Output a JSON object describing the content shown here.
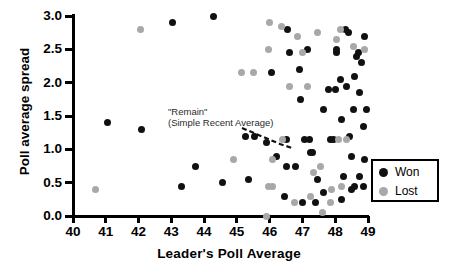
{
  "chart_data": {
    "type": "scatter",
    "title": "",
    "xlabel": "Leader's Poll Average",
    "ylabel": "Poll average spread",
    "xlim": [
      40,
      49
    ],
    "ylim": [
      0.0,
      3.0
    ],
    "xticks": [
      "40",
      "41",
      "42",
      "43",
      "44",
      "45",
      "46",
      "47",
      "48",
      "49"
    ],
    "yticks": [
      "0.0",
      "0.5",
      "1.0",
      "1.5",
      "2.0",
      "2.5",
      "3.0"
    ],
    "grid": false,
    "legend_position": "bottom-right",
    "legend": [
      {
        "name": "Won",
        "color": "#111111"
      },
      {
        "name": "Lost",
        "color": "#a8a8a8"
      }
    ],
    "annotations": [
      {
        "line1": "\"Remain\"",
        "line2": "(Simple Recent Average)",
        "points_to": [
          46.4,
          1.15
        ]
      }
    ],
    "series": [
      {
        "name": "Won",
        "color": "#111111",
        "points": [
          [
            41.05,
            1.4
          ],
          [
            42.1,
            1.3
          ],
          [
            43.05,
            2.9
          ],
          [
            44.3,
            3.0
          ],
          [
            43.75,
            0.75
          ],
          [
            43.3,
            0.45
          ],
          [
            44.55,
            0.5
          ],
          [
            45.25,
            1.2
          ],
          [
            45.55,
            1.2
          ],
          [
            45.9,
            1.1
          ],
          [
            46.45,
            0.3
          ],
          [
            46.5,
            1.15
          ],
          [
            46.05,
            2.15
          ],
          [
            46.6,
            2.45
          ],
          [
            46.55,
            2.8
          ],
          [
            46.9,
            2.2
          ],
          [
            46.95,
            1.75
          ],
          [
            47.15,
            2.5
          ],
          [
            47.05,
            1.15
          ],
          [
            47.2,
            1.15
          ],
          [
            46.5,
            0.75
          ],
          [
            46.8,
            0.75
          ],
          [
            47.25,
            0.95
          ],
          [
            47.3,
            0.95
          ],
          [
            47.45,
            0.55
          ],
          [
            47.0,
            0.2
          ],
          [
            47.4,
            0.2
          ],
          [
            47.65,
            0.35
          ],
          [
            47.65,
            1.6
          ],
          [
            47.85,
            1.15
          ],
          [
            47.95,
            1.15
          ],
          [
            48.0,
            1.9
          ],
          [
            47.8,
            1.9
          ],
          [
            48.05,
            2.45
          ],
          [
            48.05,
            2.5
          ],
          [
            48.15,
            2.05
          ],
          [
            48.2,
            1.45
          ],
          [
            48.25,
            0.6
          ],
          [
            48.2,
            0.25
          ],
          [
            48.5,
            0.4
          ],
          [
            48.5,
            0.9
          ],
          [
            48.45,
            1.2
          ],
          [
            48.55,
            1.6
          ],
          [
            48.6,
            2.1
          ],
          [
            48.65,
            2.4
          ],
          [
            48.7,
            2.45
          ],
          [
            48.8,
            2.3
          ],
          [
            48.9,
            2.7
          ],
          [
            48.75,
            1.85
          ],
          [
            48.85,
            1.35
          ],
          [
            48.9,
            0.85
          ],
          [
            48.85,
            0.45
          ],
          [
            48.6,
            0.45
          ],
          [
            48.35,
            1.95
          ],
          [
            48.4,
            2.75
          ],
          [
            48.75,
            0.6
          ],
          [
            48.95,
            1.6
          ],
          [
            48.3,
            2.8
          ],
          [
            46.2,
            0.9
          ],
          [
            45.35,
            0.55
          ]
        ]
      },
      {
        "name": "Lost",
        "color": "#a8a8a8",
        "points": [
          [
            40.7,
            0.4
          ],
          [
            42.05,
            2.8
          ],
          [
            45.15,
            2.15
          ],
          [
            45.5,
            2.15
          ],
          [
            45.95,
            2.5
          ],
          [
            46.6,
            1.95
          ],
          [
            46.1,
            0.85
          ],
          [
            46.4,
            1.15
          ],
          [
            44.9,
            0.85
          ],
          [
            45.95,
            0.45
          ],
          [
            46.1,
            0.45
          ],
          [
            45.9,
            0.0
          ],
          [
            46.35,
            2.85
          ],
          [
            46.0,
            2.9
          ],
          [
            46.85,
            2.7
          ],
          [
            47.0,
            2.45
          ],
          [
            47.15,
            1.95
          ],
          [
            47.35,
            0.65
          ],
          [
            47.55,
            0.75
          ],
          [
            47.25,
            0.3
          ],
          [
            47.6,
            0.05
          ],
          [
            47.9,
            0.4
          ],
          [
            47.85,
            0.2
          ],
          [
            48.2,
            0.45
          ],
          [
            48.1,
            1.15
          ],
          [
            48.35,
            1.15
          ],
          [
            48.05,
            2.65
          ],
          [
            48.55,
            2.55
          ],
          [
            48.9,
            2.5
          ],
          [
            48.15,
            2.8
          ],
          [
            46.75,
            0.2
          ],
          [
            47.45,
            2.75
          ]
        ]
      }
    ]
  }
}
